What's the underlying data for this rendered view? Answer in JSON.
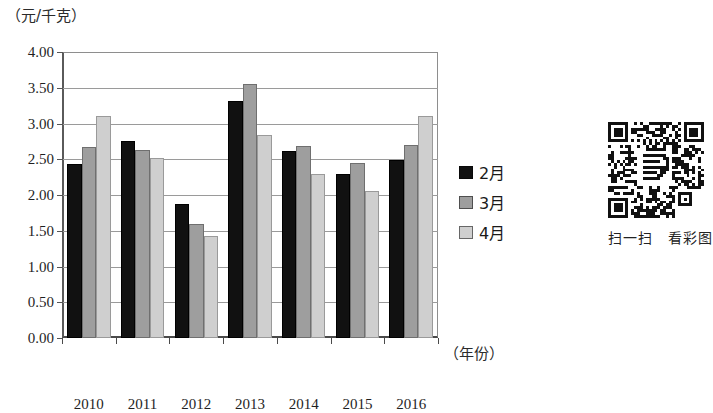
{
  "chart_data": {
    "type": "bar",
    "title": "",
    "subtitle": "",
    "xlabel": "（年份）",
    "ylabel": "（元/千克）",
    "categories": [
      "2010",
      "2011",
      "2012",
      "2013",
      "2014",
      "2015",
      "2016"
    ],
    "series": [
      {
        "name": "2月",
        "color": "#111111",
        "values": [
          2.43,
          2.76,
          1.88,
          3.31,
          2.61,
          2.3,
          2.49
        ]
      },
      {
        "name": "3月",
        "color": "#9e9e9e",
        "values": [
          2.67,
          2.63,
          1.6,
          3.55,
          2.68,
          2.45,
          2.7
        ]
      },
      {
        "name": "4月",
        "color": "#cfcfcf",
        "values": [
          3.1,
          2.52,
          1.42,
          2.84,
          2.3,
          2.06,
          3.1
        ]
      }
    ],
    "ylim": [
      0.0,
      4.0
    ],
    "ytick_step": 0.5,
    "ytick_labels": [
      "0.00",
      "0.50",
      "1.00",
      "1.50",
      "2.00",
      "2.50",
      "3.00",
      "3.50",
      "4.00"
    ],
    "grid": true,
    "legend_position": "right"
  },
  "legend": {
    "items": [
      {
        "label": "2月",
        "color": "#111111"
      },
      {
        "label": "3月",
        "color": "#9e9e9e"
      },
      {
        "label": "4月",
        "color": "#cfcfcf"
      }
    ]
  },
  "qr": {
    "caption": "扫一扫　看彩图"
  },
  "figure": {
    "caption": ""
  }
}
